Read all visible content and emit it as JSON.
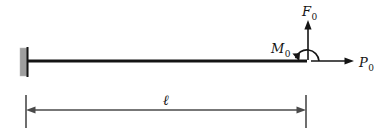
{
  "figure": {
    "type": "cantilever-beam-free-body-diagram",
    "background_color": "#ffffff"
  },
  "support": {
    "name": "fixed-wall-support",
    "fill_color": "#9e9e9e",
    "edge_color": "#141414",
    "x": 20,
    "y": 48,
    "width": 8,
    "height": 28
  },
  "beam": {
    "name": "beam",
    "color": "#141414",
    "x_start": 27,
    "x_end": 307,
    "y": 61,
    "thickness": 3
  },
  "loads": {
    "vertical_force": {
      "label": "F",
      "subscript": "0",
      "direction": "up",
      "color": "#141414",
      "tail_x": 308,
      "tail_y": 60,
      "tip_x": 308,
      "tip_y": 22,
      "label_x": 303,
      "label_y": 15
    },
    "moment": {
      "label": "M",
      "subscript": "0",
      "direction": "counterclockwise",
      "color": "#141414",
      "center_x": 307,
      "center_y": 61,
      "radius": 12,
      "label_x": 272,
      "label_y": 52
    },
    "axial_force": {
      "label": "P",
      "subscript": "0",
      "direction": "right",
      "color": "#141414",
      "tail_x": 311,
      "tail_y": 61,
      "tip_x": 353,
      "tip_y": 61,
      "label_x": 360,
      "label_y": 67
    }
  },
  "dimension": {
    "name": "beam-length-dimension",
    "label": "ℓ",
    "color": "#4a4a4a",
    "line_y": 110,
    "x_start": 26,
    "x_end": 306,
    "extension_top": 95,
    "extension_bottom": 128,
    "label_x": 166,
    "label_y": 104
  }
}
